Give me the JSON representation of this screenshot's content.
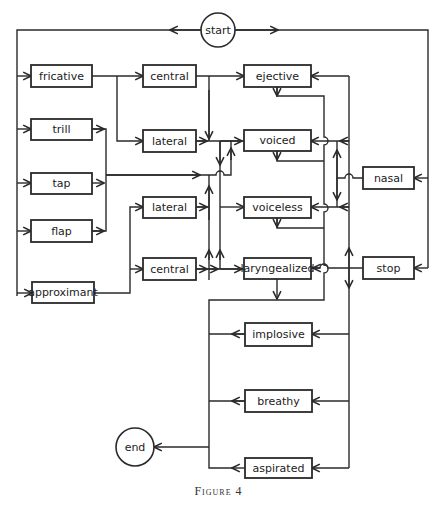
{
  "figure": {
    "caption": "Figure 4",
    "stroke_color": "#2a2a2a",
    "background": "#ffffff"
  },
  "nodes": {
    "start": {
      "label": "start",
      "shape": "circle",
      "cx": 218,
      "cy": 30,
      "r": 17
    },
    "end": {
      "label": "end",
      "shape": "circle",
      "cx": 135,
      "cy": 447,
      "r": 19
    },
    "fricative": {
      "label": "fricative",
      "x": 31,
      "y": 65,
      "w": 61,
      "h": 22
    },
    "trill": {
      "label": "trill",
      "x": 31,
      "y": 119,
      "w": 61,
      "h": 21
    },
    "tap": {
      "label": "tap",
      "x": 31,
      "y": 173,
      "w": 61,
      "h": 21
    },
    "flap": {
      "label": "flap",
      "x": 31,
      "y": 220,
      "w": 61,
      "h": 22
    },
    "approximant": {
      "label": "approximant",
      "x": 32,
      "y": 282,
      "w": 62,
      "h": 21
    },
    "central1": {
      "label": "central",
      "x": 143,
      "y": 65,
      "w": 53,
      "h": 22
    },
    "lateral1": {
      "label": "lateral",
      "x": 143,
      "y": 130,
      "w": 53,
      "h": 22
    },
    "lateral2": {
      "label": "lateral",
      "x": 143,
      "y": 197,
      "w": 53,
      "h": 21
    },
    "central2": {
      "label": "central",
      "x": 143,
      "y": 258,
      "w": 53,
      "h": 22
    },
    "ejective": {
      "label": "ejective",
      "x": 244,
      "y": 65,
      "w": 67,
      "h": 22
    },
    "voiced": {
      "label": "voiced",
      "x": 244,
      "y": 130,
      "w": 67,
      "h": 21
    },
    "voiceless": {
      "label": "voiceless",
      "x": 244,
      "y": 197,
      "w": 67,
      "h": 21
    },
    "laryngealized": {
      "label": "laryngealized",
      "x": 244,
      "y": 258,
      "w": 67,
      "h": 21
    },
    "nasal": {
      "label": "nasal",
      "x": 363,
      "y": 167,
      "w": 51,
      "h": 22
    },
    "stop": {
      "label": "stop",
      "x": 363,
      "y": 257,
      "w": 51,
      "h": 22
    },
    "implosive": {
      "label": "implosive",
      "x": 245,
      "y": 323,
      "w": 67,
      "h": 23
    },
    "breathy": {
      "label": "breathy",
      "x": 245,
      "y": 390,
      "w": 67,
      "h": 22
    },
    "aspirated": {
      "label": "aspirated",
      "x": 245,
      "y": 458,
      "w": 67,
      "h": 20
    }
  }
}
